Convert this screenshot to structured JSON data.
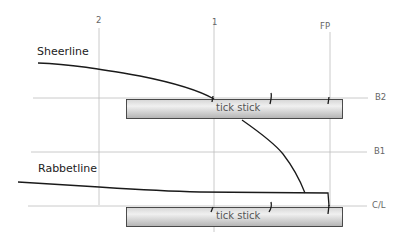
{
  "diagram": {
    "curves": {
      "sheerline": "Sheerline",
      "rabbetline": "Rabbetline"
    },
    "stations": [
      {
        "label": "2",
        "x": 99
      },
      {
        "label": "1",
        "x": 214
      },
      {
        "label": "FP",
        "x": 330
      }
    ],
    "waterlines": [
      {
        "label": "B2",
        "y": 98
      },
      {
        "label": "B1",
        "y": 152
      },
      {
        "label": "C/L",
        "y": 207
      }
    ],
    "sticks": [
      {
        "label": "tick stick"
      },
      {
        "label": "tick stick"
      }
    ],
    "colors": {
      "grid": "#b8b8b8",
      "curve": "#1a1a1a",
      "stick_fill_light": "#f2f2f2",
      "stick_fill_dark": "#bdbdbd",
      "stick_border": "#3a3a3a"
    }
  }
}
